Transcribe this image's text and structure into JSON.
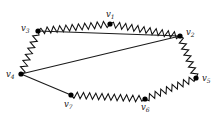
{
  "figure": {
    "background_color": "#ffffff",
    "edge_color": "#111111",
    "vertex_color": "#000000",
    "width": 222,
    "height": 121
  },
  "vertices": [
    {
      "id": "v1",
      "label_base": "v",
      "label_sub": "1",
      "x": 110,
      "y": 24,
      "label_x": 106,
      "label_y": 10
    },
    {
      "id": "v2",
      "label_base": "v",
      "label_sub": "2",
      "x": 180,
      "y": 36,
      "label_x": 186,
      "label_y": 28
    },
    {
      "id": "v3",
      "label_base": "v",
      "label_sub": "3",
      "x": 38,
      "y": 31,
      "label_x": 21,
      "label_y": 24
    },
    {
      "id": "v4",
      "label_base": "v",
      "label_sub": "4",
      "x": 21,
      "y": 74,
      "label_x": 6,
      "label_y": 70
    },
    {
      "id": "v5",
      "label_base": "v",
      "label_sub": "5",
      "x": 196,
      "y": 78,
      "label_x": 202,
      "label_y": 74
    },
    {
      "id": "v6",
      "label_base": "v",
      "label_sub": "6",
      "x": 145,
      "y": 99,
      "label_x": 141,
      "label_y": 103
    },
    {
      "id": "v7",
      "label_base": "v",
      "label_sub": "7",
      "x": 71,
      "y": 95,
      "label_x": 64,
      "label_y": 100
    }
  ],
  "edges": [
    {
      "id": "e-v3-v1",
      "from": "v3",
      "to": "v1",
      "style": "zigzag",
      "amplitude": 3.2,
      "wavelength": 6.2
    },
    {
      "id": "e-v1-v2",
      "from": "v1",
      "to": "v2",
      "style": "zigzag",
      "amplitude": 3.2,
      "wavelength": 6.2
    },
    {
      "id": "e-v3-v4",
      "from": "v3",
      "to": "v4",
      "style": "zigzag",
      "amplitude": 3.2,
      "wavelength": 6.4
    },
    {
      "id": "e-v2-v5",
      "from": "v2",
      "to": "v5",
      "style": "zigzag",
      "amplitude": 3.2,
      "wavelength": 6.4
    },
    {
      "id": "e-v5-v6",
      "from": "v5",
      "to": "v6",
      "style": "zigzag",
      "amplitude": 3.2,
      "wavelength": 6.2
    },
    {
      "id": "e-v6-v7",
      "from": "v6",
      "to": "v7",
      "style": "zigzag",
      "amplitude": 3.2,
      "wavelength": 6.2
    },
    {
      "id": "e-v3-v2",
      "from": "v3",
      "to": "v2",
      "style": "straight"
    },
    {
      "id": "e-v4-v2",
      "from": "v4",
      "to": "v2",
      "style": "straight"
    },
    {
      "id": "e-v4-v7",
      "from": "v4",
      "to": "v7",
      "style": "straight"
    }
  ],
  "vertex_radius": 2.6
}
